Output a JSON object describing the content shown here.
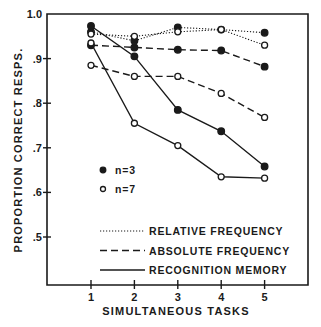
{
  "chart_data": {
    "type": "line",
    "title": "",
    "xlabel": "SIMULTANEOUS TASKS",
    "ylabel": "PROPORTION CORRECT RESPS.",
    "x": [
      1,
      2,
      3,
      4,
      5
    ],
    "x_tick_labels": [
      "1",
      "2",
      "3",
      "4",
      "5"
    ],
    "y_tick_labels": [
      "1.0",
      ".9",
      ".8",
      ".7",
      ".6",
      ".5"
    ],
    "y_ticks": [
      1.0,
      0.9,
      0.8,
      0.7,
      0.6,
      0.5
    ],
    "ylim": [
      0.39,
      1.0
    ],
    "xlim": [
      0,
      6.0
    ],
    "grid": false,
    "legend_position": "lower-left inside",
    "series": [
      {
        "name": "RELATIVE FREQUENCY, n=3",
        "task": "RELATIVE FREQUENCY",
        "n": 3,
        "line_style": "dotted",
        "marker": "filled",
        "values": [
          0.96,
          0.94,
          0.97,
          0.965,
          0.958
        ]
      },
      {
        "name": "RELATIVE FREQUENCY, n=7",
        "task": "RELATIVE FREQUENCY",
        "n": 7,
        "line_style": "dotted",
        "marker": "open",
        "values": [
          0.955,
          0.95,
          0.96,
          0.965,
          0.93
        ]
      },
      {
        "name": "ABSOLUTE FREQUENCY, n=3",
        "task": "ABSOLUTE FREQUENCY",
        "n": 3,
        "line_style": "dashed",
        "marker": "filled",
        "values": [
          0.93,
          0.925,
          0.92,
          0.918,
          0.882
        ]
      },
      {
        "name": "ABSOLUTE FREQUENCY, n=7",
        "task": "ABSOLUTE FREQUENCY",
        "n": 7,
        "line_style": "dashed",
        "marker": "open",
        "values": [
          0.885,
          0.86,
          0.86,
          0.822,
          0.768
        ]
      },
      {
        "name": "RECOGNITION MEMORY, n=3",
        "task": "RECOGNITION MEMORY",
        "n": 3,
        "line_style": "solid",
        "marker": "filled",
        "values": [
          0.973,
          0.905,
          0.785,
          0.737,
          0.658
        ]
      },
      {
        "name": "RECOGNITION MEMORY, n=7",
        "task": "RECOGNITION MEMORY",
        "n": 7,
        "line_style": "solid",
        "marker": "open",
        "values": [
          0.935,
          0.755,
          0.705,
          0.635,
          0.632
        ]
      }
    ],
    "legend": {
      "markers": [
        {
          "label": "n=3",
          "marker": "filled"
        },
        {
          "label": "n=7",
          "marker": "open"
        }
      ],
      "lines": [
        {
          "label": "RELATIVE FREQUENCY",
          "line_style": "dotted"
        },
        {
          "label": "ABSOLUTE FREQUENCY",
          "line_style": "dashed"
        },
        {
          "label": "RECOGNITION MEMORY",
          "line_style": "solid"
        }
      ]
    },
    "colors": {
      "ink": "#1a1a1a",
      "background": "#ffffff"
    }
  }
}
